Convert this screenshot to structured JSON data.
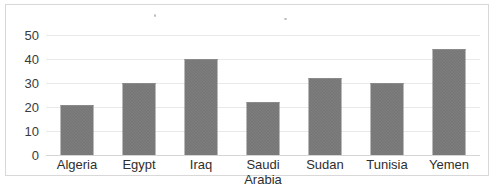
{
  "chart_data": {
    "type": "bar",
    "title": "",
    "subtitle": "",
    "xlabel": "",
    "ylabel": "",
    "categories": [
      "Algeria",
      "Egypt",
      "Iraq",
      "Saudi Arabia",
      "Sudan",
      "Tunisia",
      "Yemen"
    ],
    "values": [
      21,
      30,
      40,
      22,
      32,
      30,
      44
    ],
    "series": [
      {
        "name": "",
        "values": [
          21,
          30,
          40,
          22,
          32,
          30,
          44
        ]
      }
    ],
    "ylim": [
      0,
      55
    ],
    "yticks": [
      0,
      10,
      20,
      30,
      40,
      50
    ],
    "ytick_labels": [
      "0",
      "10",
      "20",
      "30",
      "40",
      "50"
    ],
    "grid": true,
    "legend": false,
    "legend_position": "none",
    "annotations": [],
    "colors": {
      "bar_fill": "#707070",
      "gridline": "#e9e9e9",
      "baseline": "#d5d5d5",
      "frame_border": "#d8d8d8",
      "tick_text": "#3a3a3a",
      "label_text": "#2e2e2e",
      "background": "#ffffff"
    }
  }
}
